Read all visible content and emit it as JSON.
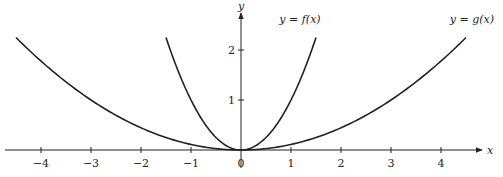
{
  "chart_data": {
    "type": "line",
    "title": "",
    "xlabel": "x",
    "ylabel": "y",
    "xlim": [
      -4.8,
      4.9
    ],
    "ylim": [
      -0.2,
      2.75
    ],
    "x_ticks": [
      -4,
      -3,
      -2,
      -1,
      0,
      1,
      2,
      3,
      4
    ],
    "x_tick_labels": [
      "−4",
      "−3",
      "−2",
      "−1",
      "0",
      "1",
      "2",
      "3",
      "4"
    ],
    "y_ticks": [
      1,
      2
    ],
    "y_tick_labels": [
      "1",
      "2"
    ],
    "grid": false,
    "series": [
      {
        "name": "y = f(x)",
        "formula": "x^2",
        "x": [
          -1.5,
          -1,
          -0.5,
          0,
          0.5,
          1,
          1.5
        ],
        "values": [
          2.25,
          1,
          0.25,
          0,
          0.25,
          1,
          2.25
        ]
      },
      {
        "name": "y = g(x)",
        "formula": "x^2/9",
        "x": [
          -4.5,
          -3,
          -1.5,
          0,
          1.5,
          3,
          4.5
        ],
        "values": [
          2.25,
          1,
          0.25,
          0,
          0.25,
          1,
          2.25
        ]
      }
    ],
    "annotations": [
      {
        "text": "y = f(x)",
        "near": "right end of f"
      },
      {
        "text": "y = g(x)",
        "near": "right end of g"
      }
    ]
  },
  "labels": {
    "x_axis": "x",
    "y_axis": "y",
    "f_label": "y = f(x)",
    "g_label": "y = g(x)"
  },
  "colors": {
    "axis": "#222222",
    "curve": "#222222"
  }
}
